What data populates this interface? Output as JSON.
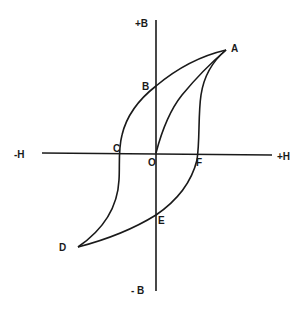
{
  "diagram": {
    "axes": {
      "y_positive_label": "+B",
      "y_negative_label": "- B",
      "x_negative_label": "-H",
      "x_positive_label": "+H",
      "origin_label": "O"
    },
    "points": [
      {
        "id": "A",
        "label": "A",
        "description": "positive saturation"
      },
      {
        "id": "B",
        "label": "B",
        "description": "positive remanence"
      },
      {
        "id": "C",
        "label": "C",
        "description": "negative coercive force"
      },
      {
        "id": "D",
        "label": "D",
        "description": "negative saturation"
      },
      {
        "id": "E",
        "label": "E",
        "description": "negative remanence"
      },
      {
        "id": "F",
        "label": "F",
        "description": "positive coercive force"
      }
    ],
    "curves": [
      {
        "id": "initial-magnetization",
        "from": "O",
        "to": "A"
      },
      {
        "id": "descending-branch",
        "path": [
          "A",
          "B",
          "C",
          "D"
        ]
      },
      {
        "id": "ascending-branch",
        "path": [
          "D",
          "E",
          "F",
          "A"
        ]
      }
    ],
    "colors": {
      "line": "#1a1a1a",
      "background": "#ffffff"
    }
  }
}
